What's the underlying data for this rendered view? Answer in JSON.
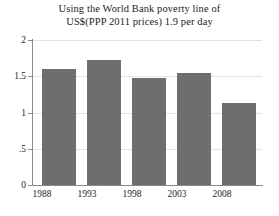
{
  "chart_data": {
    "type": "bar",
    "title": "Using the World Bank poverty line of US$(PPP 2011 prices) 1.9 per day",
    "title_lines": [
      "Using the World Bank poverty line of",
      "US$(PPP 2011 prices) 1.9 per day"
    ],
    "categories": [
      "1988",
      "1993",
      "1998",
      "2003",
      "2008"
    ],
    "values": [
      1.6,
      1.72,
      1.47,
      1.55,
      1.13
    ],
    "xlabel": "",
    "ylabel": "",
    "ylim": [
      0,
      2
    ],
    "yticks": [
      0,
      0.5,
      1,
      1.5,
      2
    ],
    "ytick_labels": [
      "0",
      ".5",
      "1",
      "1.5",
      "2"
    ],
    "grid": true,
    "legend": null,
    "bar_color": "#6e6e6e",
    "grid_color": "#e2e2e2",
    "axis_color": "#8a8a8a"
  },
  "axis": {
    "y": {
      "ticks": [
        {
          "label": "2",
          "value": 2
        },
        {
          "label": "1.5",
          "value": 1.5
        },
        {
          "label": "1",
          "value": 1
        },
        {
          "label": ".5",
          "value": 0.5
        },
        {
          "label": "0",
          "value": 0
        }
      ]
    },
    "x": {
      "ticks": [
        {
          "label": "1988"
        },
        {
          "label": "1993"
        },
        {
          "label": "1998"
        },
        {
          "label": "2003"
        },
        {
          "label": "2008"
        }
      ]
    }
  }
}
